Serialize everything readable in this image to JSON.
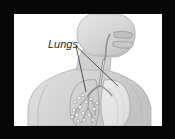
{
  "figure": {
    "kind": "anatomical-illustration",
    "view": "upper-body-three-quarter",
    "labels": [
      {
        "id": "lungs",
        "text": "Lungs",
        "style": "italic",
        "color": "#2b2b2b",
        "x": 34,
        "y": 34,
        "leader_lines": [
          {
            "from_x": 62,
            "from_y": 32,
            "to_x": 72,
            "to_y": 78
          },
          {
            "from_x": 62,
            "from_y": 32,
            "to_x": 104,
            "to_y": 72
          }
        ]
      }
    ],
    "colors": {
      "frame": "#070707",
      "panel_background": "#ffffff",
      "body_fill": "#d6d6d6",
      "body_shade": "#c2c2c2",
      "body_outline": "#9a9a9a",
      "airway_fill": "#bdbdbd",
      "airway_outline": "#8a8a8a",
      "lung_left_fill": "#cfcfcf",
      "lung_right_fill": "#e2e2e2",
      "bronchi_stroke": "#8e8e8e",
      "leader_line": "#3a3a3a"
    },
    "frame": {
      "outer_width": 175,
      "outer_height": 139,
      "panel_left": 14,
      "panel_top": 14,
      "panel_width": 148,
      "panel_height": 112
    },
    "parts": [
      {
        "name": "head",
        "label_visible": false
      },
      {
        "name": "neck",
        "label_visible": false
      },
      {
        "name": "torso",
        "label_visible": false
      },
      {
        "name": "shoulder-left",
        "label_visible": false
      },
      {
        "name": "shoulder-right",
        "label_visible": false
      },
      {
        "name": "nasal-cavity",
        "label_visible": false
      },
      {
        "name": "oral-cavity",
        "label_visible": false
      },
      {
        "name": "pharynx",
        "label_visible": false
      },
      {
        "name": "trachea",
        "label_visible": false
      },
      {
        "name": "bronchus-left",
        "label_visible": false
      },
      {
        "name": "bronchus-right",
        "label_visible": false
      },
      {
        "name": "lung-left",
        "label_visible": false
      },
      {
        "name": "lung-right",
        "label_visible": false
      },
      {
        "name": "bronchial-tree",
        "label_visible": false
      },
      {
        "name": "alveoli-cluster",
        "label_visible": false
      }
    ]
  }
}
